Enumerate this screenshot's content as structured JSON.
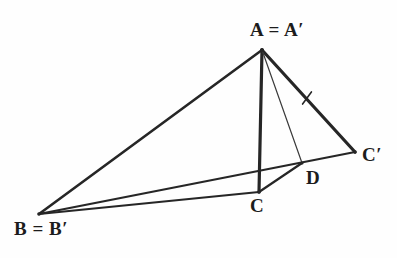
{
  "figure": {
    "kind": "geometry-diagram",
    "width": 397,
    "height": 258,
    "background_color": "#fefefe",
    "stroke_color": "#262626",
    "thin_stroke_color": "#3a3a3a",
    "labels": {
      "apex": {
        "text": "A",
        "equals": "=",
        "image": "A",
        "prime": "′",
        "full": "A = A′"
      },
      "left": {
        "text": "B",
        "equals": "=",
        "image": "B",
        "prime": "′",
        "full": "B = B′"
      },
      "bottom": {
        "text": "C",
        "full": "C"
      },
      "right": {
        "text": "C",
        "prime": "′",
        "full": "C′"
      },
      "foot": {
        "text": "D",
        "full": "D"
      }
    },
    "points": {
      "A": {
        "x": 262,
        "y": 50,
        "label": "A = A′"
      },
      "B": {
        "x": 39,
        "y": 214,
        "label": "B = B′"
      },
      "C": {
        "x": 259,
        "y": 192,
        "label": "C"
      },
      "Cp": {
        "x": 355,
        "y": 152,
        "label": "C′"
      },
      "D": {
        "x": 302,
        "y": 163,
        "label": "D"
      }
    },
    "segments": [
      {
        "name": "A-B",
        "from": "A",
        "to": "B",
        "weight": "thick",
        "width": 2.6
      },
      {
        "name": "A-C",
        "from": "A",
        "to": "C",
        "weight": "thick",
        "width": 3.2
      },
      {
        "name": "A-Cp",
        "from": "A",
        "to": "Cp",
        "weight": "thick",
        "width": 3.2
      },
      {
        "name": "A-D",
        "from": "A",
        "to": "D",
        "weight": "thin",
        "width": 1.2
      },
      {
        "name": "B-C",
        "from": "B",
        "to": "C",
        "weight": "thick",
        "width": 2.2
      },
      {
        "name": "B-Cp",
        "from": "B",
        "to": "Cp",
        "weight": "thick",
        "width": 2.2
      },
      {
        "name": "C-D",
        "from": "C",
        "to": "D",
        "weight": "thick",
        "width": 2.2
      }
    ],
    "tick_marks": [
      {
        "name": "tick-on-AC",
        "on_segment": "A-C",
        "x": 260,
        "y": 122,
        "angle": 90,
        "length": 15,
        "meaning": "congruence mark"
      },
      {
        "name": "tick-on-ACp",
        "on_segment": "A-Cp",
        "x": 307,
        "y": 98,
        "angle": 54,
        "length": 15,
        "meaning": "congruence mark"
      }
    ]
  }
}
